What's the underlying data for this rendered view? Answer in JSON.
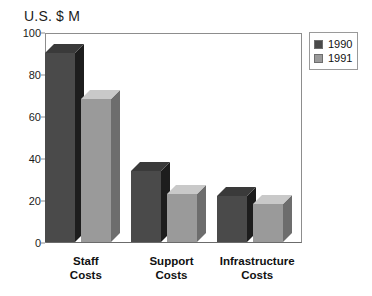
{
  "chart_data": {
    "type": "bar",
    "title": "U.S. $ M",
    "xlabel": "",
    "ylabel": "U.S. $ M",
    "categories": [
      "Staff\nCosts",
      "Support\nCosts",
      "Infrastructure\nCosts"
    ],
    "series": [
      {
        "name": "1990",
        "color": "#4a4a4a",
        "values": [
          90,
          34,
          22
        ]
      },
      {
        "name": "1991",
        "color": "#9a9a9a",
        "values": [
          68,
          23,
          18
        ]
      }
    ],
    "ylim": [
      0,
      100
    ],
    "yticks": [
      0,
      20,
      40,
      60,
      80,
      100
    ],
    "grid": false,
    "legend_position": "top-right",
    "style": "3d-isometric"
  },
  "legend": {
    "entries": [
      {
        "label": "1990",
        "swatch": "#4a4a4a"
      },
      {
        "label": "1991",
        "swatch": "#9a9a9a"
      }
    ]
  },
  "colors": {
    "series_1990_front": "#4a4a4a",
    "series_1990_top": "#3a3a3a",
    "series_1990_side": "#1d1d1d",
    "series_1991_front": "#9a9a9a",
    "series_1991_top": "#c9c9c9",
    "series_1991_side": "#6d6d6d",
    "axis": "#8d8d8d",
    "text": "#111111",
    "background": "#ffffff"
  }
}
